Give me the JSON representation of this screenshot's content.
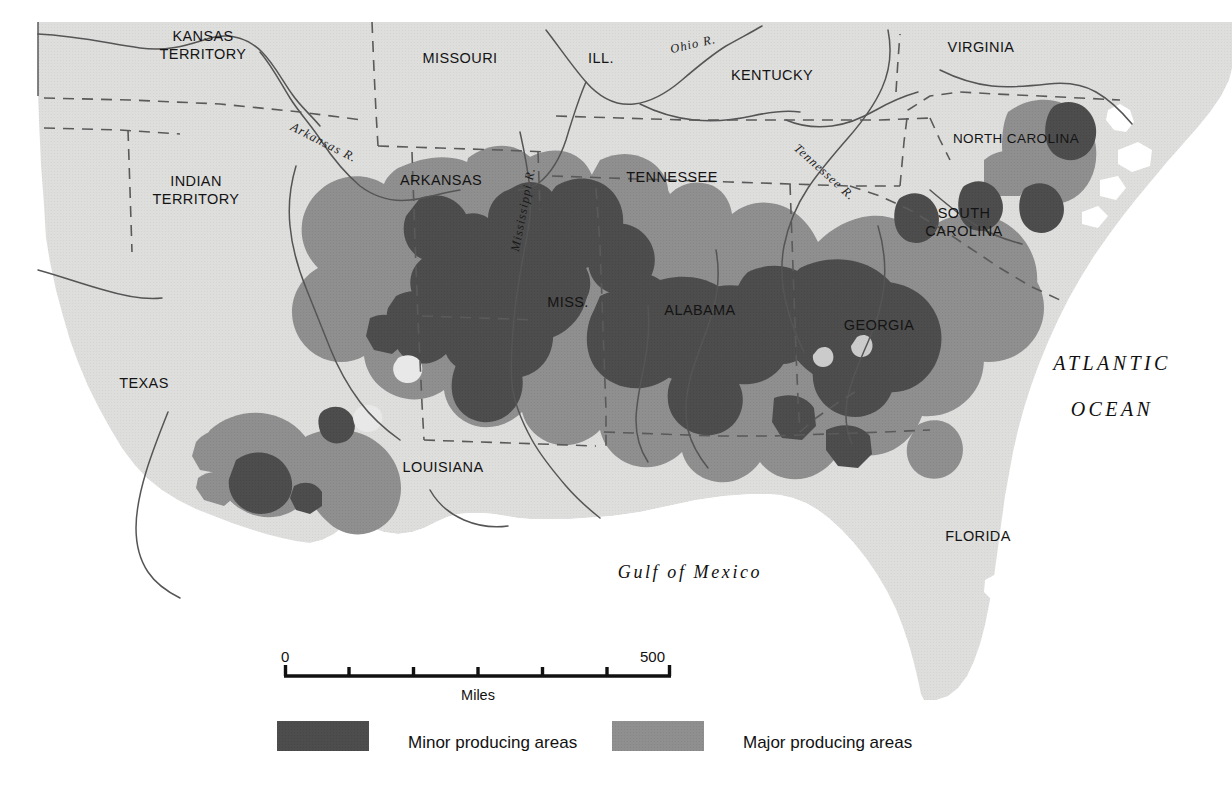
{
  "map": {
    "title": "Cotton producing areas of the American South",
    "colors": {
      "background": "#ffffff",
      "land": "#dededd",
      "major_producing": "#8f8f8f",
      "minor_producing": "#4d4d4d",
      "border_line": "#5a5a5a",
      "river_line": "#555555",
      "text": "#111111"
    },
    "state_labels": [
      {
        "name": "kansas-territory",
        "lines": [
          "KANSAS",
          "TERRITORY"
        ],
        "x": 203,
        "y": 41
      },
      {
        "name": "indian-territory",
        "lines": [
          "INDIAN",
          "TERRITORY"
        ],
        "x": 196,
        "y": 186
      },
      {
        "name": "missouri",
        "lines": [
          "MISSOURI"
        ],
        "x": 460,
        "y": 63
      },
      {
        "name": "illinois",
        "lines": [
          "ILL."
        ],
        "x": 601,
        "y": 63
      },
      {
        "name": "kentucky",
        "lines": [
          "KENTUCKY"
        ],
        "x": 772,
        "y": 80
      },
      {
        "name": "virginia",
        "lines": [
          "VIRGINIA"
        ],
        "x": 981,
        "y": 52
      },
      {
        "name": "north-carolina",
        "lines": [
          "NORTH CAROLINA"
        ],
        "x": 1016,
        "y": 143
      },
      {
        "name": "south-carolina",
        "lines": [
          "SOUTH",
          "CAROLINA"
        ],
        "x": 964,
        "y": 218
      },
      {
        "name": "arkansas",
        "lines": [
          "ARKANSAS"
        ],
        "x": 441,
        "y": 185
      },
      {
        "name": "tennessee",
        "lines": [
          "TENNESSEE"
        ],
        "x": 672,
        "y": 182
      },
      {
        "name": "mississippi",
        "lines": [
          "MISS."
        ],
        "x": 568,
        "y": 307
      },
      {
        "name": "alabama",
        "lines": [
          "ALABAMA"
        ],
        "x": 700,
        "y": 315
      },
      {
        "name": "georgia",
        "lines": [
          "GEORGIA"
        ],
        "x": 879,
        "y": 330
      },
      {
        "name": "texas",
        "lines": [
          "TEXAS"
        ],
        "x": 144,
        "y": 388
      },
      {
        "name": "louisiana",
        "lines": [
          "LOUISIANA"
        ],
        "x": 443,
        "y": 472
      },
      {
        "name": "florida",
        "lines": [
          "FLORIDA"
        ],
        "x": 978,
        "y": 541
      }
    ],
    "river_labels": [
      {
        "name": "arkansas-river",
        "text": "Arkansas R.",
        "x": 322,
        "y": 146,
        "rotate": 27
      },
      {
        "name": "ohio-river",
        "text": "Ohio R.",
        "x": 694,
        "y": 48,
        "rotate": -13
      },
      {
        "name": "tennessee-river",
        "text": "Tennessee R.",
        "x": 822,
        "y": 175,
        "rotate": 42
      },
      {
        "name": "mississippi-river",
        "text": "Mississippi R.",
        "x": 527,
        "y": 210,
        "rotate": -79
      }
    ],
    "water_labels": [
      {
        "name": "atlantic-ocean",
        "lines": [
          "ATLANTIC",
          "OCEAN"
        ],
        "x": 1112,
        "y": 370
      },
      {
        "name": "gulf-of-mexico",
        "lines": [
          "Gulf of Mexico"
        ],
        "x": 690,
        "y": 578
      }
    ]
  },
  "scale_bar": {
    "start_label": "0",
    "end_label": "500",
    "caption": "Miles",
    "ticks": 5,
    "x_start": 284,
    "x_end": 671,
    "y": 676,
    "label_y": 660,
    "caption_y": 700
  },
  "legend": {
    "items": [
      {
        "name": "legend-minor",
        "label": "Minor producing areas",
        "color": "#4d4d4d",
        "swatch_x": 277,
        "text_x": 408
      },
      {
        "name": "legend-major",
        "label": "Major producing areas",
        "color": "#8f8f8f",
        "swatch_x": 612,
        "text_x": 743
      }
    ],
    "swatch_y": 721,
    "swatch_w": 92,
    "swatch_h": 30,
    "text_y": 748
  },
  "chart_data": {
    "type": "map",
    "legend_entries": [
      "Minor producing areas",
      "Major producing areas"
    ],
    "scale_miles": [
      0,
      500
    ],
    "regions_shown": [
      "KANSAS TERRITORY",
      "INDIAN TERRITORY",
      "MISSOURI",
      "ILL.",
      "KENTUCKY",
      "VIRGINIA",
      "NORTH CAROLINA",
      "SOUTH CAROLINA",
      "ARKANSAS",
      "TENNESSEE",
      "MISS.",
      "ALABAMA",
      "GEORGIA",
      "TEXAS",
      "LOUISIANA",
      "FLORIDA"
    ],
    "rivers_shown": [
      "Arkansas R.",
      "Ohio R.",
      "Tennessee R.",
      "Mississippi R."
    ],
    "water_bodies": [
      "ATLANTIC OCEAN",
      "Gulf of Mexico"
    ]
  }
}
